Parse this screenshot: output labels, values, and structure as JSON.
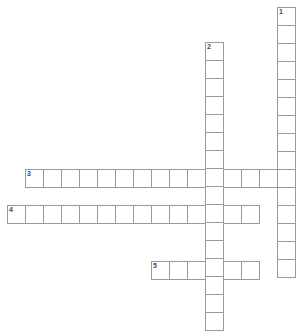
{
  "puzzle": {
    "type": "crossword-grid",
    "width": 303,
    "height": 335,
    "cell_size": 19,
    "grid_line_color": "#9a9a9a",
    "cell_fill_color": "#ffffff",
    "background_color": "#ffffff",
    "number_color": "#4a4a4a",
    "entry_count": 5,
    "entries": [
      {
        "number": "1",
        "direction": "down",
        "length": 15,
        "x": 277,
        "y": 7,
        "label": "1 Down"
      },
      {
        "number": "2",
        "direction": "down",
        "length": 16,
        "x": 205,
        "y": 42,
        "label": "2 Down"
      },
      {
        "number": "3",
        "direction": "across",
        "length": 15,
        "x": 25,
        "y": 169,
        "label": "3 Across"
      },
      {
        "number": "4",
        "direction": "across",
        "length": 14,
        "x": 7,
        "y": 205,
        "label": "4 Across"
      },
      {
        "number": "5",
        "direction": "across",
        "length": 6,
        "x": 151,
        "y": 261,
        "label": "5 Across"
      }
    ],
    "numbered_cells": [
      {
        "number": "1",
        "x": 277,
        "y": 7
      },
      {
        "number": "2",
        "x": 205,
        "y": 42
      },
      {
        "number": "3",
        "x": 25,
        "y": 169
      },
      {
        "number": "4",
        "x": 7,
        "y": 205
      },
      {
        "number": "5",
        "x": 151,
        "y": 261
      }
    ]
  }
}
